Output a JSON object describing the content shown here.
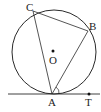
{
  "diagram": {
    "type": "geometry",
    "stroke_color": "#2a2a2a",
    "circle": {
      "center": "O",
      "cx": 54,
      "cy": 52,
      "r": 42
    },
    "points": {
      "A": {
        "label": "A",
        "x": 52,
        "y": 94
      },
      "B": {
        "label": "B",
        "x": 88,
        "y": 31
      },
      "C": {
        "label": "C",
        "x": 33,
        "y": 11
      },
      "O": {
        "label": "O",
        "x": 53,
        "y": 51
      },
      "T": {
        "label": "T",
        "x": 89,
        "y": 94
      }
    },
    "segments": [
      "AB",
      "BC",
      "CA"
    ],
    "tangent_line": {
      "through": "A",
      "x1": 8,
      "x2": 100,
      "y": 94
    },
    "angle_mark": {
      "at": "A",
      "between": [
        "B",
        "T"
      ]
    }
  }
}
